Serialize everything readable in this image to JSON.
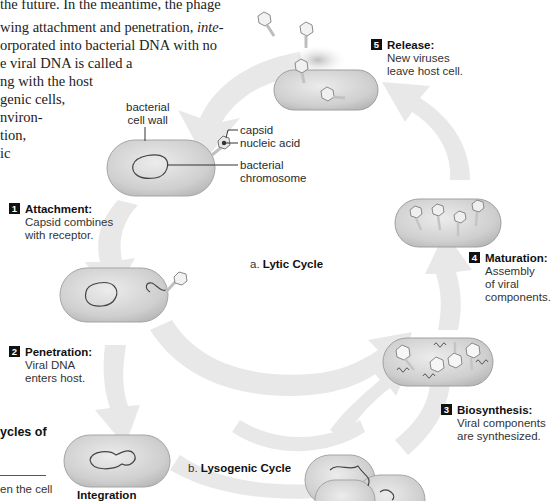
{
  "body_text": {
    "lines": [
      "the future. In the meantime, the phage",
      "wing attachment and penetration, inte-",
      "orporated into bacterial DNA with no",
      "e viral DNA is called a",
      "ng with the host",
      "genic cells,",
      "nviron-",
      "tion,",
      "ic"
    ],
    "italic_word": "inte-"
  },
  "side_box": {
    "heading": "ycles of",
    "text": "en the cell"
  },
  "labels": {
    "cell_wall": "bacterial\ncell wall",
    "cell_wall_l1": "bacterial",
    "cell_wall_l2": "cell wall",
    "capsid": "capsid",
    "nucleic_acid": "nucleic acid",
    "chromosome_l1": "bacterial",
    "chromosome_l2": "chromosome"
  },
  "steps": [
    {
      "num": "1",
      "title": "Attachment:",
      "lines": [
        "Capsid combines",
        "with receptor."
      ]
    },
    {
      "num": "2",
      "title": "Penetration:",
      "lines": [
        "Viral DNA",
        "enters host."
      ]
    },
    {
      "num": "3",
      "title": "Biosynthesis:",
      "lines": [
        "Viral components",
        "are synthesized."
      ]
    },
    {
      "num": "4",
      "title": "Maturation:",
      "lines": [
        "Assembly",
        "of viral",
        "components."
      ]
    },
    {
      "num": "5",
      "title": "Release:",
      "lines": [
        "New viruses",
        "leave host cell."
      ]
    }
  ],
  "captions": {
    "lytic_prefix": "a. ",
    "lytic": "Lytic Cycle",
    "lysogenic_prefix": "b. ",
    "lysogenic": "Lysogenic Cycle",
    "integration": "Integration"
  },
  "colors": {
    "arrow": "#e6e6e6",
    "cell_fill": "#c9c9c9",
    "cell_stroke": "#9a9a9a",
    "dna": "#444444",
    "step_badge": "#111111"
  }
}
